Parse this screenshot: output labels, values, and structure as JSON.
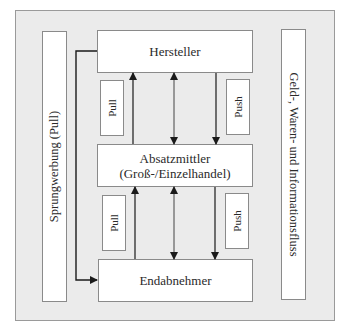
{
  "diagram": {
    "left_column": {
      "label": "Sprungwerbung (Pull)"
    },
    "right_column": {
      "label": "Geld-, Waren- und Informationsfluss"
    },
    "nodes": [
      {
        "id": "hersteller",
        "line1": "Hersteller",
        "line2": ""
      },
      {
        "id": "absatzmittler",
        "line1": "Absatzmittler",
        "line2": "(Groß-/Einzelhandel)"
      },
      {
        "id": "endabnehmer",
        "line1": "Endabnehmer",
        "line2": ""
      }
    ],
    "tags": {
      "upper_pull": "Pull",
      "upper_push": "Push",
      "lower_pull": "Pull",
      "lower_push": "Push"
    },
    "edges": [
      {
        "from": "absatzmittler",
        "to": "hersteller",
        "type": "single-arrow",
        "meaning": "Pull"
      },
      {
        "from": "hersteller",
        "to": "absatzmittler",
        "type": "double-arrow"
      },
      {
        "from": "hersteller",
        "to": "absatzmittler",
        "type": "single-arrow",
        "meaning": "Push"
      },
      {
        "from": "endabnehmer",
        "to": "absatzmittler",
        "type": "single-arrow",
        "meaning": "Pull"
      },
      {
        "from": "absatzmittler",
        "to": "endabnehmer",
        "type": "double-arrow"
      },
      {
        "from": "absatzmittler",
        "to": "endabnehmer",
        "type": "single-arrow",
        "meaning": "Push"
      },
      {
        "from": "hersteller",
        "to": "endabnehmer",
        "type": "elbow-arrow",
        "meaning": "Sprungwerbung"
      }
    ],
    "colors": {
      "frame_fill": "#ebebeb",
      "box_fill": "#ffffff",
      "border": "#8a8a8a",
      "arrow": "#1a1a1a"
    }
  }
}
